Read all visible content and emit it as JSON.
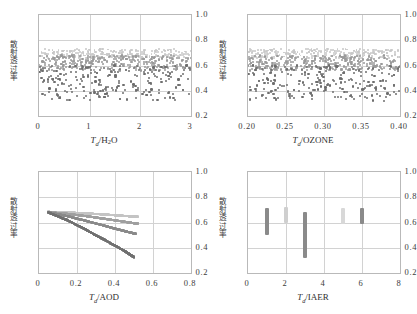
{
  "figure": {
    "ylabel_text": "散射透过率",
    "yticks": [
      "1.0",
      "0.8",
      "0.6",
      "0.4",
      "0.2"
    ],
    "ylim": [
      0.2,
      1.0
    ]
  },
  "panels": {
    "tl": {
      "xlabel_sym": "T",
      "xlabel_sub": "d",
      "xlabel_name": "/H",
      "xlabel_name2": "2",
      "xlabel_name3": "O",
      "xticks": [
        "0",
        "1",
        "2",
        "3"
      ],
      "xlim": [
        0,
        3
      ]
    },
    "tr": {
      "xlabel_sym": "T",
      "xlabel_sub": "d",
      "xlabel_name": "/OZONE",
      "xticks": [
        "0.20",
        "0.25",
        "0.30",
        "0.35",
        "0.40"
      ],
      "xlim": [
        0.2,
        0.4
      ]
    },
    "bl": {
      "xlabel_sym": "T",
      "xlabel_sub": "d",
      "xlabel_name": "/AOD",
      "xticks": [
        "0",
        "0.2",
        "0.4",
        "0.6",
        "0.8"
      ],
      "xlim": [
        0,
        0.8
      ]
    },
    "br": {
      "xlabel_sym": "T",
      "xlabel_sub": "d",
      "xlabel_name": "/IAER",
      "xticks": [
        "0",
        "2",
        "4",
        "6",
        "8"
      ],
      "xlim": [
        0,
        8
      ]
    }
  },
  "colors": {
    "band_light": "#c8c8c8",
    "band_mid": "#9a9a9a",
    "points_dark": "#6e6e6e",
    "curve_light": "#c4c4c4",
    "curve_mid": "#a0a0a0",
    "curve_dark": "#8a8a8a",
    "curve_darkest": "#707070",
    "frame": "#b9b9b9",
    "grid": "#d2d2d2"
  },
  "chart_data": {
    "type": "scatter",
    "title": "",
    "ylabel": "散射透过率",
    "ylim": [
      0.2,
      1.0
    ],
    "grid": true,
    "panels": [
      {
        "id": "tl",
        "xlabel": "T_d/H2O",
        "xlim": [
          0,
          3
        ],
        "xticks": [
          0,
          1,
          2,
          3
        ],
        "series": [
          {
            "name": "upper-light-band",
            "color": "#c8c8c8",
            "y_range": [
              0.66,
              0.73
            ],
            "n": 260
          },
          {
            "name": "mid-gray-band",
            "color": "#9a9a9a",
            "y_range": [
              0.56,
              0.68
            ],
            "n": 300
          },
          {
            "name": "lower-dark-scatter",
            "color": "#6e6e6e",
            "y_range": [
              0.32,
              0.6
            ],
            "n": 230
          }
        ]
      },
      {
        "id": "tr",
        "xlabel": "T_d/OZONE",
        "xlim": [
          0.2,
          0.4
        ],
        "xticks": [
          0.2,
          0.25,
          0.3,
          0.35,
          0.4
        ],
        "series": [
          {
            "name": "upper-light-band",
            "color": "#c8c8c8",
            "y_range": [
              0.66,
              0.73
            ],
            "n": 260
          },
          {
            "name": "mid-gray-band",
            "color": "#9a9a9a",
            "y_range": [
              0.56,
              0.68
            ],
            "n": 300
          },
          {
            "name": "lower-dark-scatter",
            "color": "#6e6e6e",
            "y_range": [
              0.32,
              0.6
            ],
            "n": 230
          }
        ]
      },
      {
        "id": "bl",
        "type": "line",
        "xlabel": "T_d/AOD",
        "xlim": [
          0,
          0.8
        ],
        "xticks": [
          0,
          0.2,
          0.4,
          0.6,
          0.8
        ],
        "series": [
          {
            "name": "curve-1-light",
            "color": "#c4c4c4",
            "x": [
              0.05,
              0.15,
              0.25,
              0.35,
              0.45,
              0.52
            ],
            "y": [
              0.685,
              0.68,
              0.672,
              0.663,
              0.652,
              0.645
            ]
          },
          {
            "name": "curve-2-mid",
            "color": "#a0a0a0",
            "x": [
              0.05,
              0.15,
              0.25,
              0.35,
              0.45,
              0.52
            ],
            "y": [
              0.682,
              0.668,
              0.65,
              0.628,
              0.606,
              0.59
            ]
          },
          {
            "name": "curve-3-dark",
            "color": "#8a8a8a",
            "x": [
              0.05,
              0.15,
              0.25,
              0.35,
              0.45,
              0.51
            ],
            "y": [
              0.68,
              0.65,
              0.612,
              0.572,
              0.532,
              0.51
            ]
          },
          {
            "name": "curve-4-darkest",
            "color": "#707070",
            "x": [
              0.05,
              0.15,
              0.25,
              0.35,
              0.45,
              0.5
            ],
            "y": [
              0.678,
              0.618,
              0.54,
              0.458,
              0.375,
              0.325
            ]
          }
        ]
      },
      {
        "id": "br",
        "type": "bar",
        "xlabel": "T_d/IAER",
        "xlim": [
          0,
          8
        ],
        "xticks": [
          0,
          2,
          4,
          6,
          8
        ],
        "bars": [
          {
            "x": 1,
            "y_low": 0.5,
            "y_high": 0.715,
            "color": "#8a8a8a"
          },
          {
            "x": 2,
            "y_low": 0.595,
            "y_high": 0.72,
            "color": "#cfcfcf"
          },
          {
            "x": 3,
            "y_low": 0.315,
            "y_high": 0.68,
            "color": "#8a8a8a"
          },
          {
            "x": 5,
            "y_low": 0.585,
            "y_high": 0.718,
            "color": "#d8d8d8"
          },
          {
            "x": 6,
            "y_low": 0.585,
            "y_high": 0.718,
            "color": "#8a8a8a"
          }
        ]
      }
    ]
  }
}
